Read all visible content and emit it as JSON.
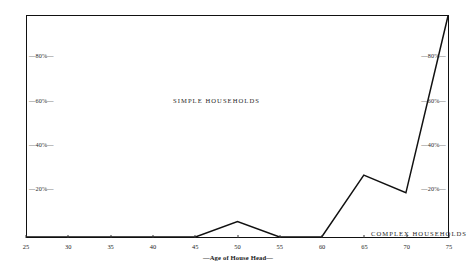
{
  "chart_data": {
    "type": "line",
    "title": "",
    "subtitle": "",
    "xlabel": "—Age of House Head—",
    "ylabel": "",
    "xlim": [
      25,
      75
    ],
    "ylim": [
      0,
      100
    ],
    "grid": false,
    "legend_position": "in-plot annotations",
    "x_ticks": [
      25,
      30,
      35,
      40,
      45,
      50,
      55,
      60,
      65,
      70,
      75
    ],
    "x_tick_labels": [
      "25",
      "30",
      "35",
      "40",
      "45",
      "50",
      "55",
      "60",
      "65",
      "70",
      "75"
    ],
    "y_ticks": [
      20,
      40,
      60,
      80
    ],
    "y_tick_labels": [
      "20%",
      "40%",
      "60%",
      "80%"
    ],
    "y_tick_labels_left": [
      "—20%—",
      "—40%—",
      "—60%—",
      "—80%—"
    ],
    "y_tick_labels_right": [
      "—20%—",
      "—40%—",
      "—60%—",
      "—80%—"
    ],
    "series": [
      {
        "name": "COMPLEX HOUSEHOLDS",
        "x": [
          25,
          30,
          35,
          40,
          45,
          50,
          55,
          60,
          65,
          70,
          75
        ],
        "values": [
          0,
          0,
          0,
          0,
          0,
          7,
          0,
          0,
          28,
          20,
          100
        ]
      }
    ],
    "annotations": [
      {
        "text": "SIMPLE HOUSEHOLDS",
        "x": 44,
        "y": 72
      },
      {
        "text": "COMPLEX HOUSEHOLDS",
        "x": 63,
        "y": 11
      }
    ],
    "colors": {
      "line": "#111111",
      "frame": "#111111",
      "text": "#1a1a1a",
      "background": "#ffffff"
    }
  },
  "axis": {
    "x_title": "—Age of House Head—",
    "x_tick_labels": [
      "25",
      "30",
      "35",
      "40",
      "45",
      "50",
      "55",
      "60",
      "65",
      "70",
      "75"
    ],
    "y_left_labels": [
      "—80%—",
      "—60%—",
      "—40%—",
      "—20%—"
    ],
    "y_right_labels": [
      "—80%—",
      "—60%—",
      "—40%—",
      "—20%—"
    ]
  },
  "labels": {
    "simple": "SIMPLE HOUSEHOLDS",
    "complex": "COMPLEX HOUSEHOLDS"
  }
}
